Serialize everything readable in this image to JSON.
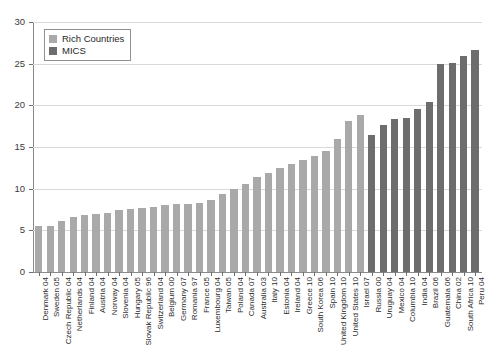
{
  "chart_data": {
    "type": "bar",
    "title": "",
    "xlabel": "",
    "ylabel": "",
    "ylim": [
      0,
      30
    ],
    "yticks": [
      0,
      5,
      10,
      15,
      20,
      25,
      30
    ],
    "grid": true,
    "legend_position": "top-left",
    "legend": [
      {
        "name": "Rich Countries",
        "color": "#a9a9a9"
      },
      {
        "name": "MICS",
        "color": "#6d6d6d"
      }
    ],
    "colors": {
      "rich": "#a9a9a9",
      "mics": "#6d6d6d",
      "axis": "#8a8a8a",
      "gridline": "#d9d9d9"
    },
    "categories": [
      "Denmark 04",
      "Sweden 05",
      "Czech Republic 04",
      "Netherlands 04",
      "Finland 04",
      "Austria 04",
      "Norway 04",
      "Slovenia 04",
      "Hungary 05",
      "Slovak Republic 96",
      "Switzerland 04",
      "Belgium 00",
      "Germany 07",
      "Romania 97",
      "France 05",
      "Luxembourg 04",
      "Taiwan 05",
      "Poland 04",
      "Canada 07",
      "Australia 03",
      "Italy 10",
      "Estonia 04",
      "Ireland 04",
      "Greece 10",
      "South Korea 06",
      "Spain 10",
      "United Kingdom 10",
      "United States 10",
      "Israel 07",
      "Russia 00",
      "Uruguay 04",
      "Mexico 04",
      "Columbia 10",
      "India 04",
      "Brazil 06",
      "Guatemala 06",
      "China 02",
      "South Africa 10",
      "Peru 04"
    ],
    "values": [
      5.5,
      5.5,
      6.1,
      6.6,
      6.9,
      7.0,
      7.1,
      7.5,
      7.6,
      7.7,
      7.8,
      8.0,
      8.2,
      8.2,
      8.3,
      8.6,
      9.4,
      10.0,
      10.6,
      11.4,
      11.9,
      12.5,
      13.0,
      13.4,
      13.9,
      14.5,
      16.0,
      18.1,
      18.9,
      16.5,
      17.6,
      18.4,
      18.5,
      19.6,
      20.4,
      25.0,
      25.1,
      25.9,
      26.7
    ],
    "series_of": [
      "rich",
      "rich",
      "rich",
      "rich",
      "rich",
      "rich",
      "rich",
      "rich",
      "rich",
      "rich",
      "rich",
      "rich",
      "rich",
      "rich",
      "rich",
      "rich",
      "rich",
      "rich",
      "rich",
      "rich",
      "rich",
      "rich",
      "rich",
      "rich",
      "rich",
      "rich",
      "rich",
      "rich",
      "rich",
      "mics",
      "mics",
      "mics",
      "mics",
      "mics",
      "mics",
      "mics",
      "mics",
      "mics",
      "mics"
    ]
  }
}
